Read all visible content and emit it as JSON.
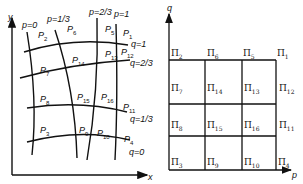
{
  "left_panel": {
    "axes": {
      "x_label": "x",
      "y_label": "y"
    },
    "curve_labels_p": [
      "p=0",
      "p=1/3",
      "p=2/3",
      "p=1"
    ],
    "curve_labels_q": [
      "q=1",
      "q=2/3",
      "q=1/3",
      "q=0"
    ],
    "points": [
      {
        "id": "P",
        "sub": "1"
      },
      {
        "id": "P",
        "sub": "2"
      },
      {
        "id": "P",
        "sub": "3"
      },
      {
        "id": "P",
        "sub": "4"
      },
      {
        "id": "P",
        "sub": "5"
      },
      {
        "id": "P",
        "sub": "6"
      },
      {
        "id": "P",
        "sub": "7"
      },
      {
        "id": "P",
        "sub": "8"
      },
      {
        "id": "P",
        "sub": "9"
      },
      {
        "id": "P",
        "sub": "10"
      },
      {
        "id": "P",
        "sub": "11"
      },
      {
        "id": "P",
        "sub": "12"
      },
      {
        "id": "P",
        "sub": "13"
      },
      {
        "id": "P",
        "sub": "14"
      },
      {
        "id": "P",
        "sub": "15"
      },
      {
        "id": "P",
        "sub": "16"
      }
    ]
  },
  "right_panel": {
    "axes": {
      "x_label": "p",
      "y_label": "q"
    },
    "cells": [
      {
        "id": "Π",
        "sub": "2"
      },
      {
        "id": "Π",
        "sub": "6"
      },
      {
        "id": "Π",
        "sub": "5"
      },
      {
        "id": "Π",
        "sub": "1"
      },
      {
        "id": "Π",
        "sub": "7"
      },
      {
        "id": "Π",
        "sub": "14"
      },
      {
        "id": "Π",
        "sub": "13"
      },
      {
        "id": "Π",
        "sub": "12"
      },
      {
        "id": "Π",
        "sub": "8"
      },
      {
        "id": "Π",
        "sub": "15"
      },
      {
        "id": "Π",
        "sub": "16"
      },
      {
        "id": "Π",
        "sub": "11"
      },
      {
        "id": "Π",
        "sub": "3"
      },
      {
        "id": "Π",
        "sub": "9"
      },
      {
        "id": "Π",
        "sub": "10"
      },
      {
        "id": "Π",
        "sub": "4"
      }
    ]
  }
}
